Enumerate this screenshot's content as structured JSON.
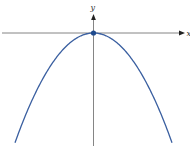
{
  "chart_data": {
    "type": "line",
    "title": "",
    "xlabel": "x",
    "ylabel": "y",
    "grid": false,
    "legend": null,
    "function": "y = -a·x² (downward-opening parabola with vertex at origin)",
    "series": [
      {
        "name": "parabola",
        "color": "#3a5fa0",
        "x": [
          -4,
          -3,
          -2,
          -1,
          0,
          1,
          2,
          3,
          4
        ],
        "values": [
          -16,
          -9,
          -4,
          -1,
          0,
          -1,
          -4,
          -9,
          -16
        ]
      }
    ],
    "points": [
      {
        "name": "vertex",
        "x": 0,
        "y": 0,
        "color": "#1f4b8f"
      }
    ],
    "axes": {
      "color": "#555555",
      "x_label": "x",
      "y_label": "y"
    }
  }
}
